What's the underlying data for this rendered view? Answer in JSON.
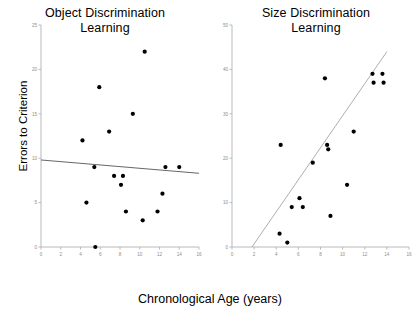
{
  "figure": {
    "shared_xlabel": "Chronological Age (years)",
    "shared_ylabel": "Errors to Criterion",
    "background_color": "#ffffff",
    "point_color": "#000000",
    "axis_color": "#b9b9b9",
    "tick_label_color": "#8d8d8d",
    "fitline_color": "#555555"
  },
  "chart_data": [
    {
      "type": "scatter",
      "id": "object-discrimination",
      "title": "Object Discrimination Learning",
      "title_lines": [
        "Object Discrimination",
        "Learning"
      ],
      "xlabel": "Chronological Age (years)",
      "ylabel": "Errors to Criterion",
      "xlim": [
        0,
        16
      ],
      "ylim": [
        0,
        25
      ],
      "xticks": [
        0,
        2,
        4,
        6,
        8,
        10,
        12,
        14,
        16
      ],
      "xtick_labels": [
        "0",
        "2",
        "4",
        "6",
        "8",
        "10",
        "12",
        "14",
        "16"
      ],
      "yticks": [
        0,
        5,
        10,
        15,
        20,
        25
      ],
      "ytick_labels": [
        "0",
        "5",
        "10",
        "15",
        "20",
        "25"
      ],
      "grid": false,
      "legend": false,
      "points": [
        {
          "x": 4.2,
          "y": 12
        },
        {
          "x": 4.6,
          "y": 5
        },
        {
          "x": 5.4,
          "y": 9
        },
        {
          "x": 5.5,
          "y": 0
        },
        {
          "x": 5.9,
          "y": 18
        },
        {
          "x": 6.9,
          "y": 13
        },
        {
          "x": 7.4,
          "y": 8
        },
        {
          "x": 8.1,
          "y": 7
        },
        {
          "x": 8.3,
          "y": 8
        },
        {
          "x": 8.6,
          "y": 4
        },
        {
          "x": 9.3,
          "y": 15
        },
        {
          "x": 10.3,
          "y": 3
        },
        {
          "x": 10.5,
          "y": 22
        },
        {
          "x": 11.8,
          "y": 4
        },
        {
          "x": 12.3,
          "y": 6
        },
        {
          "x": 12.6,
          "y": 9
        },
        {
          "x": 14.0,
          "y": 9
        }
      ],
      "fit_line": {
        "x0": 0,
        "y0": 9.8,
        "x1": 16,
        "y1": 8.3,
        "slope_sign": "negative"
      }
    },
    {
      "type": "scatter",
      "id": "size-discrimination",
      "title": "Size Discrimination Learning",
      "title_lines": [
        "Size Discrimination",
        "Learning"
      ],
      "xlabel": "Chronological Age (years)",
      "ylabel": "Errors to Criterion",
      "xlim": [
        0,
        16
      ],
      "ylim": [
        0,
        50
      ],
      "xticks": [
        0,
        2,
        4,
        6,
        8,
        10,
        12,
        14,
        16
      ],
      "xtick_labels": [
        "0",
        "2",
        "4",
        "6",
        "8",
        "10",
        "12",
        "14",
        "16"
      ],
      "yticks": [
        0,
        10,
        20,
        30,
        40,
        50
      ],
      "ytick_labels": [
        "0",
        "10",
        "20",
        "30",
        "40",
        "50"
      ],
      "grid": false,
      "legend": false,
      "points": [
        {
          "x": 4.3,
          "y": 3
        },
        {
          "x": 4.4,
          "y": 23
        },
        {
          "x": 5.0,
          "y": 1
        },
        {
          "x": 5.4,
          "y": 9
        },
        {
          "x": 6.1,
          "y": 11
        },
        {
          "x": 6.4,
          "y": 9
        },
        {
          "x": 7.3,
          "y": 19
        },
        {
          "x": 8.4,
          "y": 38
        },
        {
          "x": 8.6,
          "y": 23
        },
        {
          "x": 8.7,
          "y": 22
        },
        {
          "x": 8.9,
          "y": 7
        },
        {
          "x": 10.4,
          "y": 14
        },
        {
          "x": 11.0,
          "y": 26
        },
        {
          "x": 12.7,
          "y": 39
        },
        {
          "x": 12.8,
          "y": 37
        },
        {
          "x": 13.6,
          "y": 39
        },
        {
          "x": 13.7,
          "y": 37
        }
      ],
      "fit_line": {
        "x0": 1.8,
        "y0": 0,
        "x1": 14.0,
        "y1": 44,
        "slope_sign": "positive"
      }
    }
  ]
}
